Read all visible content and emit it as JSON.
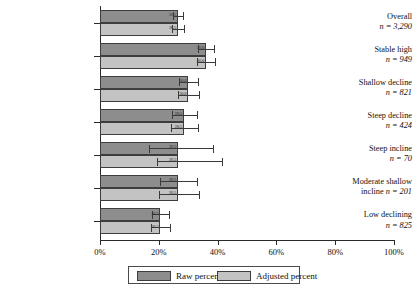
{
  "chart_data": {
    "type": "bar",
    "orientation": "horizontal",
    "title": "",
    "xlabel": "",
    "ylabel": "",
    "xlim": [
      0,
      100
    ],
    "grid": false,
    "legend_position": "bottom",
    "xticks": [
      "0%",
      "20%",
      "40%",
      "60%",
      "80%",
      "100%"
    ],
    "xtick_values": [
      0,
      20,
      40,
      60,
      80,
      100
    ],
    "categories": [
      "Overall",
      "Stable high",
      "Shallow decline",
      "Steep decline",
      "Steep incline",
      "Moderate shallow incline",
      "Low declining"
    ],
    "category_n": [
      "n = 3,290",
      "n = 949",
      "n = 821",
      "n = 424",
      "n = 70",
      "n = 201",
      "n = 825"
    ],
    "series": [
      {
        "name": "Raw percent",
        "color": "#8d8d8d",
        "values": [
          26.5,
          36.0,
          30.0,
          28.5,
          26.5,
          26.5,
          20.5
        ],
        "labels": [
          "26.5",
          "36.0",
          "30.0",
          "28.5",
          "26.5",
          "26.5",
          "20.5"
        ],
        "err_low": [
          24.8,
          33.3,
          26.8,
          24.5,
          16.5,
          20.5,
          17.8
        ],
        "err_high": [
          28.2,
          38.8,
          33.3,
          33.0,
          38.5,
          33.0,
          23.5
        ]
      },
      {
        "name": "Adjusted percent",
        "color": "#c3c3c3",
        "values": [
          26.5,
          36.0,
          30.0,
          28.5,
          26.5,
          26.5,
          20.5
        ],
        "labels": [
          "26.5",
          "36.0",
          "30.0",
          "28.5",
          "26.5",
          "26.5",
          "20.5"
        ],
        "err_low": [
          24.5,
          33.0,
          26.5,
          24.0,
          19.5,
          20.0,
          17.5
        ],
        "err_high": [
          28.5,
          39.2,
          33.8,
          33.5,
          41.5,
          33.8,
          23.8
        ]
      }
    ]
  },
  "legend": {
    "raw_label": "Raw percent",
    "adjusted_label": "Adjusted percent"
  }
}
